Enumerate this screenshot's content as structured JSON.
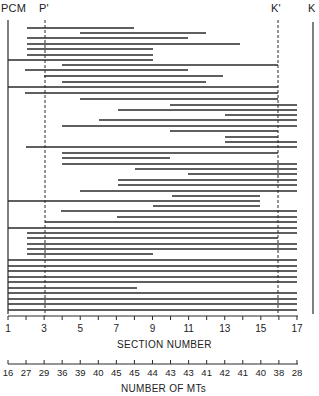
{
  "labels": {
    "pcm": "PCM",
    "p_prime": "P'",
    "k_prime": "K'",
    "k": "K"
  },
  "section_axis": {
    "title": "SECTION NUMBER",
    "tick_labels": [
      "1",
      "3",
      "5",
      "7",
      "9",
      "11",
      "13",
      "15",
      "17"
    ]
  },
  "mt_axis": {
    "title": "NUMBER OF MTs",
    "tick_labels": [
      "16",
      "27",
      "29",
      "36",
      "39",
      "40",
      "45",
      "45",
      "44",
      "43",
      "43",
      "41",
      "42",
      "41",
      "40",
      "38",
      "28"
    ]
  },
  "chart_data": {
    "type": "diagram",
    "title": "",
    "xlabel": "SECTION NUMBER",
    "secondary_xlabel": "NUMBER OF MTs",
    "x_range": [
      1,
      17
    ],
    "sections": [
      1,
      2,
      3,
      4,
      5,
      6,
      7,
      8,
      9,
      10,
      11,
      12,
      13,
      14,
      15,
      16,
      17
    ],
    "mt_counts": [
      16,
      27,
      29,
      36,
      39,
      40,
      45,
      45,
      44,
      43,
      43,
      41,
      42,
      41,
      40,
      38,
      28
    ],
    "markers": [
      {
        "name": "PCM",
        "section": 1,
        "style": "solid"
      },
      {
        "name": "P'",
        "section": 3,
        "style": "dashed"
      },
      {
        "name": "K'",
        "section": 16,
        "style": "dashed"
      },
      {
        "name": "K",
        "section": 17.9,
        "style": "solid"
      }
    ],
    "segments_px": [
      [
        27,
        134,
        28
      ],
      [
        80,
        206,
        33
      ],
      [
        27,
        188,
        38
      ],
      [
        27,
        240,
        44
      ],
      [
        27,
        153,
        49
      ],
      [
        27,
        153,
        55
      ],
      [
        8,
        153,
        60
      ],
      [
        62,
        278,
        65
      ],
      [
        25,
        188,
        70
      ],
      [
        44,
        223,
        76
      ],
      [
        62,
        206,
        82
      ],
      [
        8,
        278,
        87
      ],
      [
        25,
        278,
        93
      ],
      [
        80,
        278,
        99
      ],
      [
        170,
        297,
        105
      ],
      [
        118,
        297,
        110
      ],
      [
        225,
        297,
        115
      ],
      [
        99,
        297,
        120
      ],
      [
        62,
        297,
        126
      ],
      [
        170,
        278,
        131
      ],
      [
        225,
        278,
        137
      ],
      [
        225,
        297,
        142
      ],
      [
        26,
        297,
        147
      ],
      [
        62,
        278,
        153
      ],
      [
        62,
        170,
        158
      ],
      [
        62,
        297,
        164
      ],
      [
        135,
        297,
        169
      ],
      [
        188,
        297,
        174
      ],
      [
        118,
        297,
        180
      ],
      [
        118,
        297,
        185
      ],
      [
        80,
        297,
        191
      ],
      [
        172,
        260,
        196
      ],
      [
        8,
        260,
        201
      ],
      [
        153,
        260,
        206
      ],
      [
        61,
        297,
        211
      ],
      [
        117,
        297,
        217
      ],
      [
        45,
        297,
        222
      ],
      [
        8,
        297,
        228
      ],
      [
        27,
        297,
        233
      ],
      [
        27,
        278,
        238
      ],
      [
        27,
        297,
        244
      ],
      [
        27,
        297,
        249
      ],
      [
        27,
        153,
        254
      ],
      [
        8,
        297,
        260
      ],
      [
        8,
        297,
        266
      ],
      [
        8,
        297,
        271
      ],
      [
        8,
        297,
        277
      ],
      [
        8,
        297,
        282
      ],
      [
        8,
        137,
        288
      ],
      [
        8,
        297,
        293
      ],
      [
        8,
        297,
        299
      ],
      [
        8,
        297,
        304
      ],
      [
        8,
        297,
        310
      ]
    ]
  }
}
